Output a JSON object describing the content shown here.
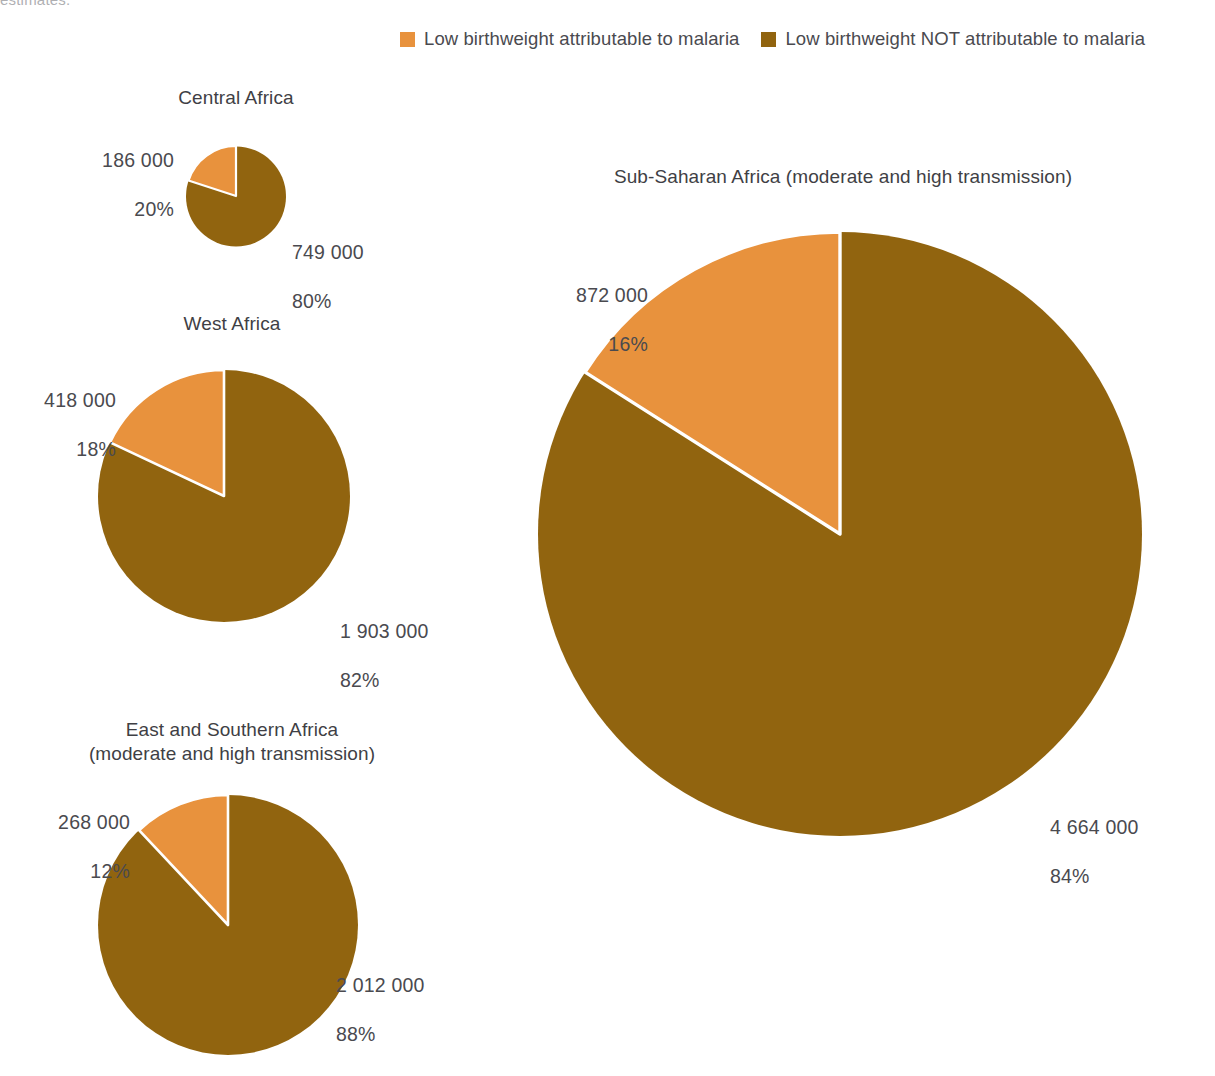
{
  "cropped_header_text": "estimates.",
  "colors": {
    "attributable": "#e8923d",
    "not_attributable": "#91640f",
    "slice_border": "#ffffff",
    "text": "#4a4a4f",
    "background": "#ffffff"
  },
  "legend": {
    "items": [
      {
        "label": "Low birthweight attributable to malaria",
        "color": "#e8923d"
      },
      {
        "label": "Low birthweight NOT attributable to malaria",
        "color": "#91640f"
      }
    ]
  },
  "chart_data": {
    "type": "pie",
    "title": "",
    "legend": [
      "Low birthweight attributable to malaria",
      "Low birthweight NOT attributable to malaria"
    ],
    "legend_position": "top",
    "series_names": [
      "Low birthweight attributable to malaria",
      "Low birthweight NOT attributable to malaria"
    ],
    "charts": [
      {
        "id": "central-africa",
        "title": "Central Africa",
        "radius_px": 50,
        "slices": [
          {
            "name": "Low birthweight attributable to malaria",
            "value": 186000,
            "value_label": "186 000",
            "percent": 20,
            "percent_label": "20%",
            "color": "#e8923d"
          },
          {
            "name": "Low birthweight NOT attributable to malaria",
            "value": 749000,
            "value_label": "749 000",
            "percent": 80,
            "percent_label": "80%",
            "color": "#91640f"
          }
        ],
        "total": 935000
      },
      {
        "id": "west-africa",
        "title": "West Africa",
        "radius_px": 126,
        "slices": [
          {
            "name": "Low birthweight attributable to malaria",
            "value": 418000,
            "value_label": "418 000",
            "percent": 18,
            "percent_label": "18%",
            "color": "#e8923d"
          },
          {
            "name": "Low birthweight NOT attributable to malaria",
            "value": 1903000,
            "value_label": "1 903 000",
            "percent": 82,
            "percent_label": "82%",
            "color": "#91640f"
          }
        ],
        "total": 2321000
      },
      {
        "id": "east-southern-africa",
        "title": "East and Southern Africa\n(moderate and high transmission)",
        "radius_px": 130,
        "slices": [
          {
            "name": "Low birthweight attributable to malaria",
            "value": 268000,
            "value_label": "268 000",
            "percent": 12,
            "percent_label": "12%",
            "color": "#e8923d"
          },
          {
            "name": "Low birthweight NOT attributable to malaria",
            "value": 2012000,
            "value_label": "2 012 000",
            "percent": 88,
            "percent_label": "88%",
            "color": "#91640f"
          }
        ],
        "total": 2280000
      },
      {
        "id": "sub-saharan-africa",
        "title": "Sub-Saharan Africa (moderate and high transmission)",
        "radius_px": 302,
        "slices": [
          {
            "name": "Low birthweight attributable to malaria",
            "value": 872000,
            "value_label": "872 000",
            "percent": 16,
            "percent_label": "16%",
            "color": "#e8923d"
          },
          {
            "name": "Low birthweight NOT attributable to malaria",
            "value": 4664000,
            "value_label": "4 664 000",
            "percent": 84,
            "percent_label": "84%",
            "color": "#91640f"
          }
        ],
        "total": 5536000
      }
    ]
  }
}
